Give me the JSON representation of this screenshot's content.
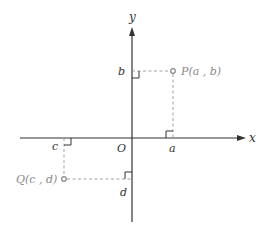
{
  "diagram": {
    "type": "coordinate-plane",
    "axes": {
      "x_label": "x",
      "y_label": "y",
      "origin_label": "O"
    },
    "points": [
      {
        "name": "P",
        "label": "P(a , b)",
        "x_label": "a",
        "y_label": "b",
        "quadrant": 1
      },
      {
        "name": "Q",
        "label": "Q(c , d)",
        "x_label": "c",
        "y_label": "d",
        "quadrant": 3
      }
    ],
    "colors": {
      "axis": "#333333",
      "dashed": "#999999",
      "point": "#888888",
      "text": "#333333",
      "point_label": "#888888"
    }
  }
}
